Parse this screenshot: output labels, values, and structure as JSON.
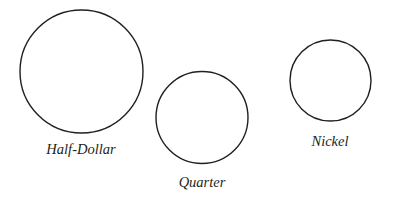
{
  "figure": {
    "background_color": "#ffffff",
    "stroke_color": "#231f20",
    "label_color": "#231f20",
    "width": 396,
    "height": 198
  },
  "chart_data": {
    "type": "scatter",
    "title": "",
    "subtitle": "",
    "xlabel": "",
    "ylabel": "",
    "grid": false,
    "legend": "none",
    "categories": [
      "Half-Dollar",
      "Quarter",
      "Nickel"
    ],
    "values": [
      123,
      92,
      81
    ],
    "value_units": "px diameter",
    "series": [
      {
        "name": "coin-outline-diameter-px",
        "values": [
          123,
          92,
          81
        ]
      }
    ],
    "items": [
      {
        "label": "Half-Dollar",
        "cx": 81.5,
        "cy": 71.5,
        "r": 61.5,
        "diameter": 123,
        "stroke_width": 1.4,
        "label_x": 81,
        "label_y": 154,
        "label_font_size": 14.5
      },
      {
        "label": "Quarter",
        "cx": 202,
        "cy": 117.5,
        "r": 46,
        "diameter": 92,
        "stroke_width": 1.4,
        "label_x": 202,
        "label_y": 187,
        "label_font_size": 14.5
      },
      {
        "label": "Nickel",
        "cx": 330.5,
        "cy": 80.5,
        "r": 40.5,
        "diameter": 81,
        "stroke_width": 1.4,
        "label_x": 330,
        "label_y": 146,
        "label_font_size": 14.5
      }
    ]
  }
}
